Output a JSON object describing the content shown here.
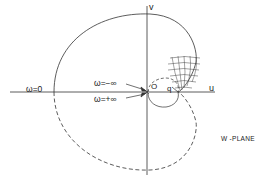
{
  "diagram": {
    "type": "nyquist-plot",
    "plane_label": "W -PLANE",
    "axes": {
      "horizontal": "u",
      "vertical": "v"
    },
    "annotations": {
      "omega_zero": "ω=0",
      "omega_neg_inf": "ω=−∞",
      "omega_pos_inf": "ω=+∞",
      "origin": "O",
      "point_q": "q"
    },
    "colors": {
      "ink": "#222222",
      "background": "#ffffff"
    }
  }
}
